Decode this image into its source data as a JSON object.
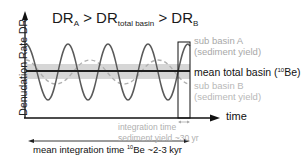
{
  "title": {
    "dr": "DR",
    "sub_a": "A",
    "gt1": " > DR",
    "sub_total": "total basin",
    "gt2": " > DR",
    "sub_b": "B"
  },
  "axes": {
    "y_label": "Denudation Rate DR",
    "x_label": "time"
  },
  "legend": {
    "sub_basin_a_line1": "sub basin A",
    "sub_basin_a_line2": "(sediment yield)",
    "mean_total_pre": "mean total basin (",
    "mean_total_sup": "10",
    "mean_total_post": "Be)",
    "sub_basin_b_line1": "sub basin B",
    "sub_basin_b_line2": "(sediment yield)"
  },
  "annotations": {
    "integration_line1": "integration time",
    "integration_line2": "sediment yield ~30 yr",
    "mean_integration_pre": "mean integration time ",
    "mean_integration_sup": "10",
    "mean_integration_post": "Be ~2-3 kyr"
  },
  "colors": {
    "curve_a": "#555555",
    "curve_b": "#b5b5b5",
    "band": "#d3d3d3",
    "mean_line": "#222222",
    "axis": "#111111"
  }
}
